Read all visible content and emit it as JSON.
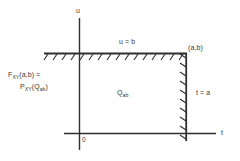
{
  "figure": {
    "background_color": "#ffffff",
    "line_color": "#2f2f2f",
    "text_color": "#3a3a3a"
  },
  "axes": {
    "vertical_label": "u",
    "horizontal_label": "t",
    "origin_label": "0"
  },
  "boundaries": {
    "top_line_label": "u = b",
    "right_line_label": "t = a",
    "corner_point_label": "(a,b)"
  },
  "region": {
    "name_main": "Q",
    "name_sub": "ab"
  },
  "formula": {
    "line1_main": "F",
    "line1_sub": "XY",
    "line1_rest": "(a,b) =",
    "line2_main": "P",
    "line2_sub": "XY",
    "line2_open": "(Q",
    "line2_sub2": "ab",
    "line2_close": ")"
  }
}
